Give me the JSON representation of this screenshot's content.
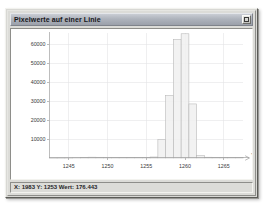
{
  "window": {
    "title": "Pixelwerte auf einer Linie",
    "close_button_name": "close-button"
  },
  "status": {
    "text": "X: 1983  Y: 1253  Wert: 176.443",
    "x_value": "1983",
    "y_value": "1253",
    "wert_value": "176.443"
  },
  "colors": {
    "titlebar_from": "#c9cdd4",
    "titlebar_to": "#9ba0aa",
    "window_face": "#dcdcd8",
    "plot_background": "#ffffff",
    "grid": "#e3e3e6",
    "axis": "#9d9d9d",
    "bar_fill": "#f0f0f0",
    "bar_stroke": "#b8b8b8"
  },
  "chart_data": {
    "type": "bar",
    "title": "Pixelwerte auf einer Linie",
    "xlabel": "Y",
    "ylabel": "",
    "xlim": [
      1242.5,
      1267.5
    ],
    "ylim": [
      0,
      66000
    ],
    "grid": true,
    "legend": null,
    "bar_width": 1,
    "xticks": [
      1245,
      1250,
      1255,
      1260,
      1265
    ],
    "yticks": [
      10000,
      20000,
      30000,
      40000,
      50000,
      60000
    ],
    "xtick_labels": [
      "1245",
      "1250",
      "1255",
      "1260",
      "1265"
    ],
    "ytick_labels": [
      "10000",
      "20000",
      "30000",
      "40000",
      "50000",
      "60000"
    ],
    "categories": [
      1243,
      1244,
      1245,
      1246,
      1247,
      1248,
      1249,
      1250,
      1251,
      1252,
      1253,
      1254,
      1255,
      1256,
      1257,
      1258,
      1259,
      1260,
      1261,
      1262,
      1263,
      1264,
      1265,
      1266,
      1267
    ],
    "values": [
      60,
      70,
      90,
      140,
      260,
      420,
      380,
      300,
      250,
      220,
      200,
      230,
      300,
      520,
      9800,
      33000,
      62500,
      65500,
      28500,
      1200,
      400,
      330,
      300,
      280,
      250
    ]
  }
}
